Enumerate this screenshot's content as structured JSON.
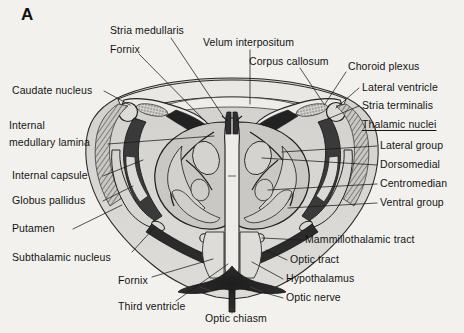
{
  "figure": {
    "panel_letter": "A",
    "background_color": "#f2f1ed",
    "ink_color": "#141414"
  },
  "labels": {
    "left": [
      {
        "id": "stria-medullaris",
        "text": "Stria medullaris",
        "x": 110,
        "y": 30
      },
      {
        "id": "fornix-top",
        "text": "Fornix",
        "x": 110,
        "y": 49
      },
      {
        "id": "caudate-nucleus",
        "text": "Caudate nucleus",
        "x": 12,
        "y": 90
      },
      {
        "id": "internal-medullary-lamina-1",
        "text": "Internal",
        "x": 9,
        "y": 125
      },
      {
        "id": "internal-medullary-lamina-2",
        "text": "medullary lamina",
        "x": 9,
        "y": 142
      },
      {
        "id": "internal-capsule",
        "text": "Internal capsule",
        "x": 12,
        "y": 175
      },
      {
        "id": "globus-pallidus",
        "text": "Globus pallidus",
        "x": 12,
        "y": 200
      },
      {
        "id": "putamen",
        "text": "Putamen",
        "x": 12,
        "y": 228
      },
      {
        "id": "subthalamic-nucleus",
        "text": "Subthalamic nucleus",
        "x": 12,
        "y": 257
      },
      {
        "id": "fornix-bottom",
        "text": "Fornix",
        "x": 118,
        "y": 280
      },
      {
        "id": "third-ventricle",
        "text": "Third ventricle",
        "x": 118,
        "y": 306
      }
    ],
    "top": [
      {
        "id": "velum-interpositum",
        "text": "Velum interpositum",
        "x": 203,
        "y": 42
      },
      {
        "id": "corpus-callosum",
        "text": "Corpus callosum",
        "x": 249,
        "y": 61
      }
    ],
    "right": [
      {
        "id": "choroid-plexus",
        "text": "Choroid plexus",
        "x": 348,
        "y": 66
      },
      {
        "id": "lateral-ventricle",
        "text": "Lateral ventricle",
        "x": 362,
        "y": 87
      },
      {
        "id": "stria-terminalis",
        "text": "Stria terminalis",
        "x": 362,
        "y": 105
      },
      {
        "id": "thalamic-nuclei",
        "text": "Thalamic nuclei",
        "x": 362,
        "y": 124,
        "underline": true
      },
      {
        "id": "lateral-group",
        "text": "Lateral group",
        "x": 380,
        "y": 145
      },
      {
        "id": "dorsomedial",
        "text": "Dorsomedial",
        "x": 380,
        "y": 164
      },
      {
        "id": "centromedian",
        "text": "Centromedian",
        "x": 380,
        "y": 183
      },
      {
        "id": "ventral-group",
        "text": "Ventral group",
        "x": 380,
        "y": 202
      },
      {
        "id": "mammillothalamic-tract",
        "text": "Mammillothalamic tract",
        "x": 305,
        "y": 239
      },
      {
        "id": "optic-tract",
        "text": "Optic tract",
        "x": 290,
        "y": 259
      },
      {
        "id": "hypothalamus",
        "text": "Hypothalamus",
        "x": 286,
        "y": 278
      },
      {
        "id": "optic-nerve",
        "text": "Optic nerve",
        "x": 286,
        "y": 297
      }
    ],
    "bottom": [
      {
        "id": "optic-chiasm",
        "text": "Optic chiasm",
        "x": 205,
        "y": 318
      }
    ]
  },
  "anatomy_colors": {
    "background_tissue": "#d7d6d2",
    "thalamus_gray": "#c6c5c1",
    "pale_gray": "#dcdbd7",
    "white_matter": "#e8e7e3",
    "dark_tract": "#2e2e2e",
    "mid_dark": "#575757",
    "outline": "#1c1c1c"
  }
}
